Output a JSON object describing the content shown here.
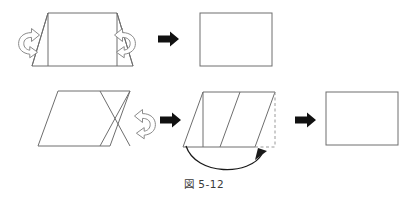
{
  "figure": {
    "caption": "図 5-12",
    "background_color": "#ffffff",
    "outline_color": "#6e6e6e",
    "solid_arrow_color": "#111111",
    "fold_arrow_stroke": "#8a8a8a",
    "dashed_color": "#9a9a9a",
    "curve_arrow_color": "#1a1a1a"
  },
  "rows": [
    {
      "id": "row-1",
      "label": "trapezoid-to-rectangle",
      "shapes": [
        {
          "id": "row1-trapezoid",
          "name": "trapezoid-with-inscribed-rectangle",
          "type": "polygon",
          "points": "48,13 117,13 133,66 32,66",
          "inner_lines": [
            {
              "name": "inner-rect-left-edge",
              "x1": 48,
              "y1": 13,
              "x2": 48,
              "y2": 66
            },
            {
              "name": "inner-rect-right-edge",
              "x1": 117,
              "y1": 13,
              "x2": 117,
              "y2": 66
            },
            {
              "name": "left-fold-crease",
              "x1": 48,
              "y1": 13,
              "x2": 32,
              "y2": 66
            },
            {
              "name": "right-fold-crease",
              "x1": 117,
              "y1": 13,
              "x2": 133,
              "y2": 66
            }
          ]
        },
        {
          "id": "row1-result-rect",
          "name": "result-rectangle",
          "type": "rect",
          "x": 200,
          "y": 13,
          "width": 72,
          "height": 53
        }
      ],
      "fold_arrows": [
        {
          "id": "row1-fold-left",
          "name": "fold-arrow-left",
          "cx": 30,
          "cy": 39,
          "flip": true
        },
        {
          "id": "row1-fold-right",
          "name": "fold-arrow-right",
          "cx": 124,
          "cy": 39,
          "flip": false
        }
      ],
      "solid_arrows": [
        {
          "id": "row1-arrow-1",
          "name": "process-arrow",
          "x": 158,
          "y": 39
        }
      ]
    },
    {
      "id": "row-2",
      "label": "parallelogram-to-rectangle",
      "shapes": [
        {
          "id": "row2-parallelogram",
          "name": "parallelogram-with-crossed-creases",
          "type": "polygon",
          "points": "58,91 130,91 110,146 38,146",
          "inner_lines": [
            {
              "name": "crease-down-right",
              "x1": 100,
              "y1": 91,
              "x2": 130,
              "y2": 146
            },
            {
              "name": "crease-up-right",
              "x1": 130,
              "y1": 91,
              "x2": 100,
              "y2": 146
            }
          ]
        },
        {
          "id": "row2-folded-parallelogram",
          "name": "partially-folded-parallelogram",
          "type": "polygon",
          "points": "203,92 275,92 255,147 183,147",
          "inner_lines": [
            {
              "name": "inner-crease-vertical",
              "x1": 203,
              "y1": 92,
              "x2": 203,
              "y2": 147
            },
            {
              "name": "folded-edge-crease",
              "x1": 240,
              "y1": 92,
              "x2": 220,
              "y2": 147
            }
          ],
          "dashed_lines": [
            {
              "name": "dashed-right-edge",
              "x1": 275,
              "y1": 92,
              "x2": 275,
              "y2": 147
            },
            {
              "name": "dashed-bottom-edge",
              "x1": 255,
              "y1": 147,
              "x2": 275,
              "y2": 147
            }
          ]
        },
        {
          "id": "row2-result-rect",
          "name": "result-rectangle",
          "type": "rect",
          "x": 326,
          "y": 92,
          "width": 72,
          "height": 53
        }
      ],
      "fold_arrows": [
        {
          "id": "row2-fold",
          "name": "fold-arrow",
          "cx": 144,
          "cy": 120,
          "flip": false
        }
      ],
      "solid_arrows": [
        {
          "id": "row2-arrow-1",
          "name": "process-arrow",
          "x": 160,
          "y": 120
        },
        {
          "id": "row2-arrow-2",
          "name": "process-arrow",
          "x": 295,
          "y": 120
        }
      ],
      "curve_arrow": {
        "id": "row2-swing-arrow",
        "name": "fold-swing-arrow",
        "path": "M 186,146 C 196,176 250,176 262,154",
        "head": "258,148 266,152 256,159"
      }
    }
  ]
}
